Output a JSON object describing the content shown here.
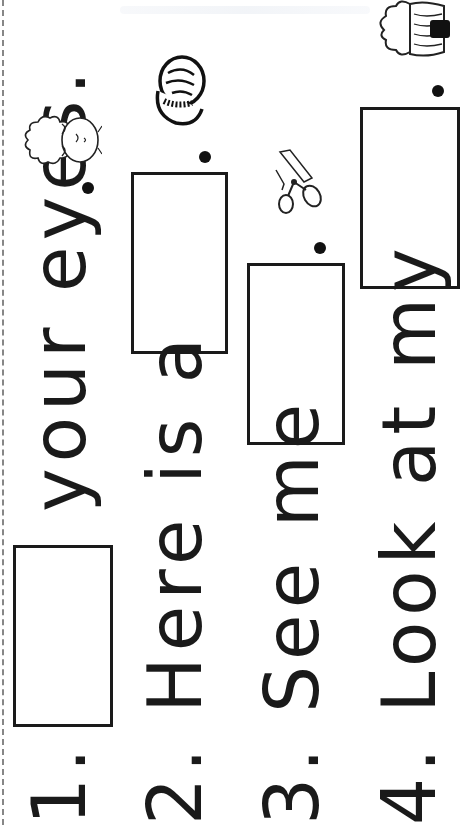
{
  "worksheet": {
    "orientation": "rotated-90-ccw",
    "sentences": [
      {
        "number": "1.",
        "before": "",
        "after": "your eyes.",
        "picture": "face-closed-eyes"
      },
      {
        "number": "2.",
        "before": "Here is a",
        "after": ".",
        "picture": "nut"
      },
      {
        "number": "3.",
        "before": "See me",
        "after": ".",
        "picture": "scissors-cutting"
      },
      {
        "number": "4.",
        "before": "Look at my",
        "after": ".",
        "picture": "hair"
      }
    ]
  }
}
